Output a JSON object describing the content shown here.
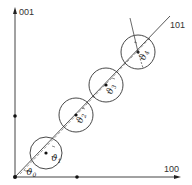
{
  "diagram": {
    "axes": {
      "vertical_label": "001",
      "horizontal_label": "100",
      "diagonal_label": "101"
    },
    "colors": {
      "line": "#444444",
      "dot": "#111111",
      "background": "#ffffff"
    },
    "angles": [
      {
        "symbol": "ϑ",
        "sub": "0"
      },
      {
        "symbol": "ϑ",
        "sub": "1"
      },
      {
        "symbol": "ϑ",
        "sub": "2"
      },
      {
        "symbol": "ϑ",
        "sub": "3"
      },
      {
        "symbol": "ϑ",
        "sub": "4"
      }
    ]
  }
}
